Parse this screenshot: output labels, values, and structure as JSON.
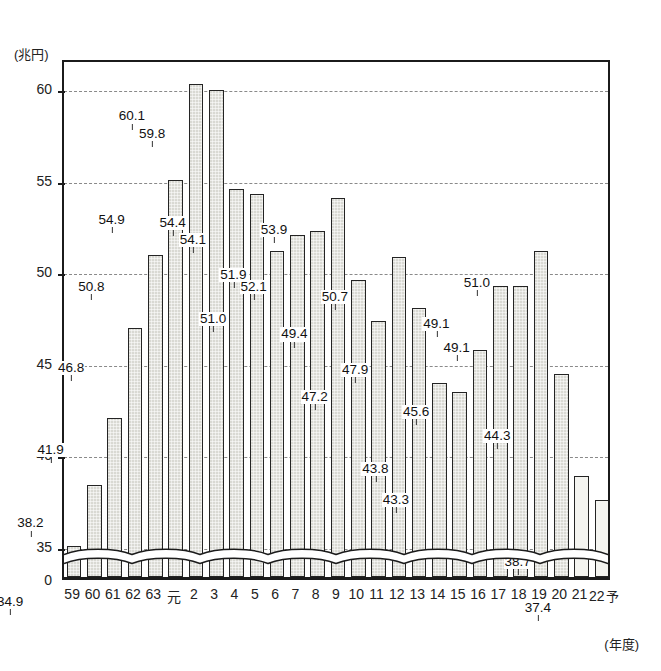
{
  "chart_data": {
    "type": "bar",
    "title": "",
    "subtitle": "",
    "unit_label": "(兆円)",
    "xlabel": "(年度)",
    "ylabel": "",
    "ylim": [
      33.2,
      61.6
    ],
    "yticks": [
      0,
      35,
      40,
      45,
      50,
      55,
      60
    ],
    "ytick_labels": [
      "0",
      "35",
      "40",
      "45",
      "50",
      "55",
      "60"
    ],
    "grid": true,
    "legend": false,
    "axis_break": true,
    "axis_break_note": "wavy break between 0 and 35",
    "categories": [
      "59",
      "60",
      "61",
      "62",
      "63",
      "元",
      "2",
      "3",
      "4",
      "5",
      "6",
      "7",
      "8",
      "9",
      "10",
      "11",
      "12",
      "13",
      "14",
      "15",
      "16",
      "17",
      "18",
      "19",
      "20",
      "21",
      "22"
    ],
    "last_category_suffix": "予",
    "values": [
      34.9,
      38.2,
      41.9,
      46.8,
      50.8,
      54.9,
      60.1,
      59.8,
      54.4,
      54.1,
      51.0,
      51.9,
      52.1,
      53.9,
      49.4,
      47.2,
      50.7,
      47.9,
      43.8,
      43.3,
      45.6,
      49.1,
      49.1,
      51.0,
      44.3,
      38.7,
      37.4
    ],
    "labeled_values": [
      "34.9",
      "38.2",
      "41.9",
      "46.8",
      "50.8",
      "54.9",
      "60.1",
      "59.8",
      "54.4",
      "54.1",
      "51.0",
      "51.9",
      "52.1",
      "53.9",
      "49.4",
      "47.2",
      "50.7",
      "47.9",
      "43.8",
      "43.3",
      "45.6",
      "49.1",
      "49.1",
      "51.0",
      "44.3",
      "38.7",
      "37.4"
    ],
    "forecast_indices": [
      25,
      26
    ],
    "colors": {
      "bar_fill": "#d9d9d3",
      "bar_fill_forecast": "#f4f4f0",
      "bar_stroke": "#242424",
      "gridline": "#8a8a8a",
      "axis": "#1b1b1b",
      "text": "#1a1a1a",
      "background": "#ffffff"
    }
  }
}
